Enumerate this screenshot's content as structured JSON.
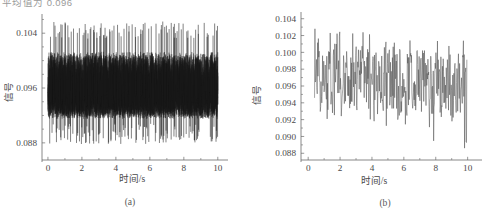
{
  "figure": {
    "truncated_header_text": "平均值为 0.096",
    "panels": [
      {
        "id": "a",
        "caption": "(a)",
        "xlabel": "时间/s",
        "ylabel": "信号"
      },
      {
        "id": "b",
        "caption": "(b)",
        "xlabel": "时间/s",
        "ylabel": "信号"
      }
    ]
  },
  "chart_data": [
    {
      "type": "line",
      "id": "a",
      "title": "",
      "xlabel": "时间/s",
      "ylabel": "信号",
      "xlim": [
        -0.35,
        10.6
      ],
      "ylim": [
        0.0855,
        0.1068
      ],
      "xticks": [
        0,
        2,
        4,
        6,
        8,
        10
      ],
      "xtick_labels": [
        "0",
        "2",
        "4",
        "6",
        "8",
        "10"
      ],
      "yticks": [
        0.088,
        0.096,
        0.104
      ],
      "ytick_labels": [
        "0.088",
        "0.096",
        "0.104"
      ],
      "yticks_minor": [
        0.09,
        0.092,
        0.094,
        0.098,
        0.1,
        0.102,
        0.106
      ],
      "grid": false,
      "legend": null,
      "description": "Dense high-frequency noisy signal, band roughly 0.0915-0.1013 with frequent spikes reaching 0.088 and 0.1055",
      "band_low": 0.0915,
      "band_high": 0.1013,
      "spike_low": 0.0878,
      "spike_high": 0.1057,
      "mean": 0.0964,
      "n_points": 2000,
      "x": [
        0,
        10
      ],
      "values": [
        0.0964,
        0.0964
      ]
    },
    {
      "type": "line",
      "id": "b",
      "title": "",
      "xlabel": "时间/s",
      "ylabel": "信号",
      "xlim": [
        -0.45,
        10.9
      ],
      "ylim": [
        0.0872,
        0.1048
      ],
      "xticks": [
        0,
        2,
        4,
        6,
        8,
        10
      ],
      "xtick_labels": [
        "0",
        "2",
        "4",
        "6",
        "8",
        "10"
      ],
      "yticks": [
        0.088,
        0.09,
        0.092,
        0.094,
        0.096,
        0.098,
        0.1,
        0.102,
        0.104
      ],
      "ytick_labels": [
        "0.088",
        "0.090",
        "0.092",
        "0.094",
        "0.096",
        "0.098",
        "0.100",
        "0.102",
        "0.104"
      ],
      "grid": false,
      "legend": null,
      "description": "Filtered noisy signal oscillating mostly between 0.092 and 0.103, with downward excursions to 0.0885 near t=8 and t=9.9",
      "band_low": 0.0925,
      "band_high": 0.1025,
      "spike_low": 0.0885,
      "spike_high": 0.1032,
      "mean": 0.0962,
      "n_points": 400,
      "x": [
        0.4,
        9.95
      ],
      "values": [
        0.0962,
        0.0962
      ]
    }
  ]
}
